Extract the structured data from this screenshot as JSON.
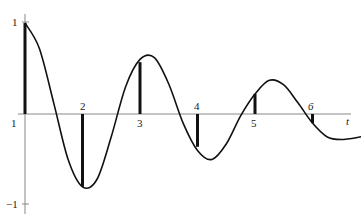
{
  "chart_data": {
    "type": "line",
    "title": "",
    "xlabel": "t",
    "ylabel": "",
    "xlim": [
      1,
      7.05
    ],
    "ylim": [
      -1,
      1
    ],
    "grid": false,
    "x_ticks": [
      "1",
      "2",
      "3",
      "4",
      "5",
      "6"
    ],
    "y_ticks": [
      "1",
      "-1"
    ],
    "series": [
      {
        "name": "damped oscillation curve",
        "kind": "line",
        "x": [
          1.0,
          1.25,
          1.5,
          1.75,
          2.0,
          2.25,
          2.5,
          2.75,
          3.0,
          3.25,
          3.5,
          3.75,
          4.0,
          4.25,
          4.5,
          4.75,
          5.0,
          5.25,
          5.5,
          5.75,
          6.0,
          6.25,
          6.5,
          6.85
        ],
        "values": [
          1.0,
          0.72,
          0.12,
          -0.5,
          -0.8,
          -0.72,
          -0.25,
          0.3,
          0.6,
          0.62,
          0.33,
          -0.1,
          -0.4,
          -0.5,
          -0.33,
          -0.02,
          0.22,
          0.37,
          0.32,
          0.12,
          -0.1,
          -0.25,
          -0.28,
          -0.25
        ]
      },
      {
        "name": "samples",
        "kind": "stem",
        "x": [
          1,
          2,
          3,
          4,
          5,
          6
        ],
        "values": [
          1.0,
          -0.8,
          0.57,
          -0.36,
          0.22,
          -0.1
        ]
      }
    ]
  },
  "labels": {
    "y_top": "1",
    "y_bottom": "−1",
    "x_origin": "1",
    "x_2": "2",
    "x_3": "3",
    "x_4": "4",
    "x_5": "5",
    "x_6": "6",
    "axis_t": "t"
  },
  "colors": {
    "axis": "#888888",
    "curve": "#111111",
    "stem": "#111111"
  }
}
